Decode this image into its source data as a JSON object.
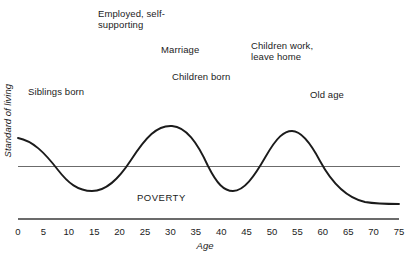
{
  "chart_data": {
    "type": "line",
    "title": "",
    "xlabel": "Age",
    "ylabel": "Standard of living",
    "xlim": [
      0,
      75
    ],
    "xticks": [
      0,
      5,
      10,
      15,
      20,
      25,
      30,
      35,
      40,
      45,
      50,
      55,
      60,
      65,
      70,
      75
    ],
    "grid": false,
    "legend": "none",
    "series": [
      {
        "name": "Standard of living",
        "color": "#1b1b1b",
        "x": [
          0,
          3,
          7,
          11,
          15,
          19,
          23,
          26,
          30,
          33,
          37,
          41,
          45,
          48,
          52,
          56,
          60,
          64,
          68,
          72,
          75
        ],
        "y": [
          0.82,
          0.74,
          0.52,
          0.26,
          0.1,
          0.12,
          0.36,
          0.67,
          0.93,
          0.82,
          0.42,
          0.1,
          0.2,
          0.55,
          0.85,
          0.72,
          0.46,
          0.26,
          0.14,
          0.08,
          0.06
        ]
      }
    ],
    "reference_lines": [
      {
        "name": "poverty-line",
        "label": "POVERTY",
        "orientation": "horizontal",
        "value": 0.38,
        "color": "#6b6b6b"
      }
    ],
    "annotations": [
      {
        "id": "siblings-born",
        "text": "Siblings born",
        "x": 5,
        "y": 0.78
      },
      {
        "id": "employed-self-supporting",
        "text": "Employed, self-\nsupporting",
        "x": 22,
        "y": 1.22
      },
      {
        "id": "marriage",
        "text": "Marriage",
        "x": 32,
        "y": 1.05
      },
      {
        "id": "children-born",
        "text": "Children born",
        "x": 35,
        "y": 0.92
      },
      {
        "id": "children-work-leave-home",
        "text": "Children work,\nleave home",
        "x": 50,
        "y": 1.1
      },
      {
        "id": "old-age",
        "text": "Old age",
        "x": 62,
        "y": 0.8
      }
    ]
  },
  "labels": {
    "siblings_born": "Siblings born",
    "employed_self_supporting": "Employed, self-\nsupporting",
    "marriage": "Marriage",
    "children_born": "Children born",
    "children_work_leave_home": "Children work,\nleave home",
    "old_age": "Old age",
    "poverty": "POVERTY"
  },
  "axes": {
    "x_title": "Age",
    "y_title": "Standard of living",
    "x_tick_labels": [
      "0",
      "5",
      "10",
      "15",
      "20",
      "25",
      "30",
      "35",
      "40",
      "45",
      "50",
      "55",
      "60",
      "65",
      "70",
      "75"
    ]
  },
  "colors": {
    "curve": "#1b1b1b",
    "poverty_line": "#6b6b6b",
    "axis": "#6b6b6b",
    "text": "#1b1b1b",
    "background": "#ffffff"
  }
}
